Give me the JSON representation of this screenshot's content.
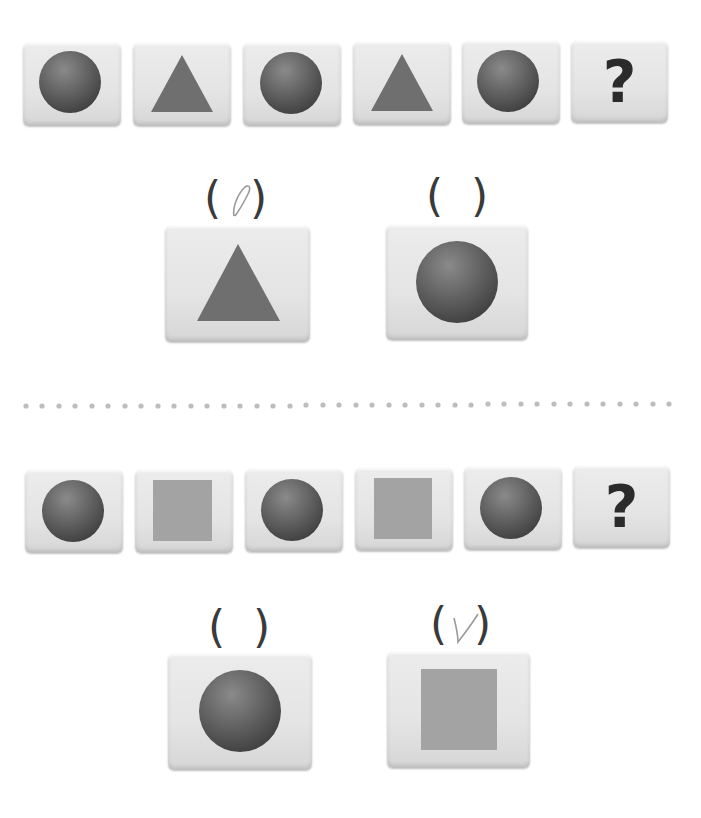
{
  "problems": [
    {
      "sequence": [
        {
          "shape": "circle"
        },
        {
          "shape": "triangle"
        },
        {
          "shape": "circle"
        },
        {
          "shape": "triangle"
        },
        {
          "shape": "circle"
        },
        {
          "shape": "question",
          "symbol": "?"
        }
      ],
      "options": [
        {
          "shape": "triangle",
          "paren_open": "(",
          "paren_close": ")",
          "marked": true,
          "mark": "✓"
        },
        {
          "shape": "circle",
          "paren_open": "(",
          "paren_close": ")",
          "marked": false,
          "mark": ""
        }
      ]
    },
    {
      "sequence": [
        {
          "shape": "circle"
        },
        {
          "shape": "square"
        },
        {
          "shape": "circle"
        },
        {
          "shape": "square"
        },
        {
          "shape": "circle"
        },
        {
          "shape": "question",
          "symbol": "?"
        }
      ],
      "options": [
        {
          "shape": "circle",
          "paren_open": "(",
          "paren_close": ")",
          "marked": false,
          "mark": ""
        },
        {
          "shape": "square",
          "paren_open": "(",
          "paren_close": ")",
          "marked": true,
          "mark": "✓"
        }
      ]
    }
  ],
  "colors": {
    "circle_light": "#8a8a8a",
    "circle_dark": "#3e3e3e",
    "triangle": "#6f6f6f",
    "square": "#a3a3a3",
    "qmark": "#2b2b2b",
    "dots": "#bdbdbd",
    "check": "#9a9a9a"
  }
}
